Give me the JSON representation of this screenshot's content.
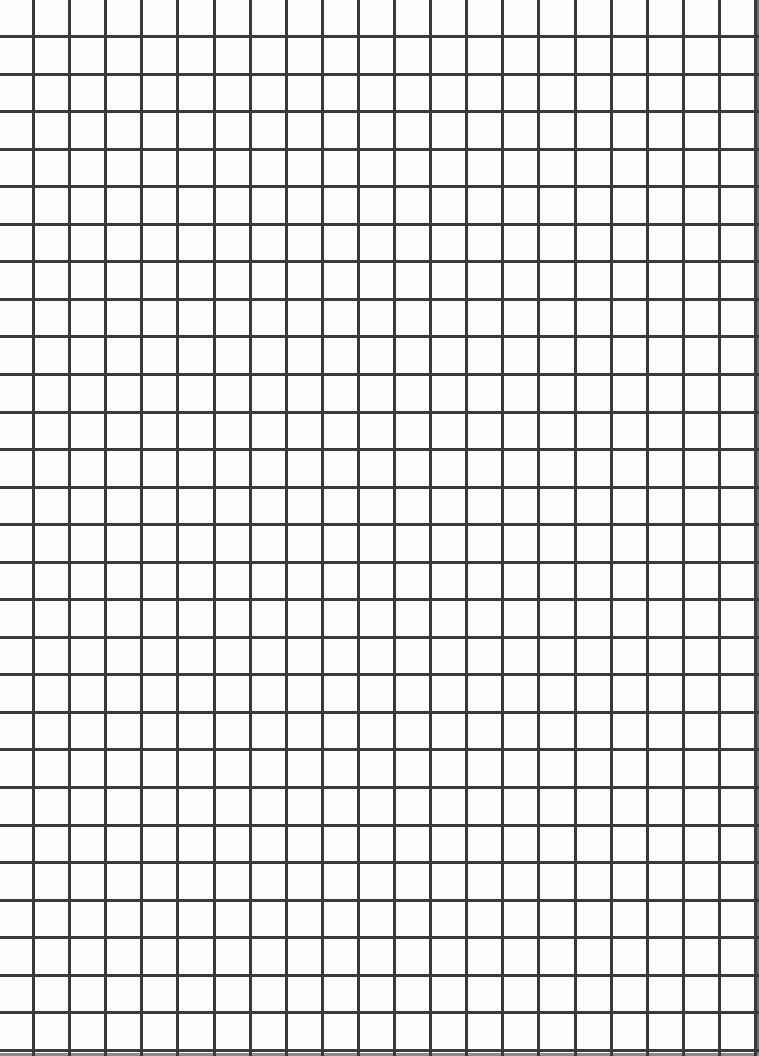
{
  "grid": {
    "width": 759,
    "height": 1056,
    "line_color": "#3a3a3a",
    "background": "#fdfdfd",
    "line_width": 3,
    "vertical": {
      "start": 32,
      "spacing": 36.1,
      "count": 21
    },
    "horizontal": {
      "start": 35,
      "spacing": 37.55,
      "count": 28
    }
  }
}
